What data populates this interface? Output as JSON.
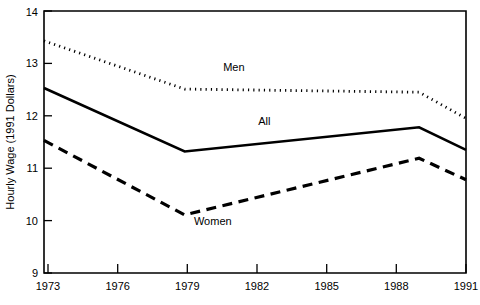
{
  "chart_data": {
    "type": "line",
    "title": "",
    "xlabel": "",
    "ylabel": "Hourly Wage (1991 Dollars)",
    "xlim": [
      1973,
      1991
    ],
    "ylim": [
      9,
      14
    ],
    "grid": false,
    "legend_position": "inline-labels",
    "x_ticks": [
      "1973",
      "1976",
      "1979",
      "1982",
      "1985",
      "1988",
      "1991"
    ],
    "y_ticks": [
      "9",
      "10",
      "11",
      "12",
      "13",
      "14"
    ],
    "x": [
      1973,
      1979,
      1989,
      1991
    ],
    "series": [
      {
        "name": "Men",
        "style": "dotted",
        "label": "Men",
        "values": [
          13.43,
          12.51,
          12.45,
          11.95
        ]
      },
      {
        "name": "All",
        "style": "solid",
        "label": "All",
        "values": [
          12.53,
          11.32,
          11.78,
          11.35
        ]
      },
      {
        "name": "Women",
        "style": "dashed",
        "label": "Women",
        "values": [
          11.53,
          10.11,
          11.19,
          10.78
        ]
      }
    ],
    "annotations": [
      {
        "text": "Men",
        "x": 1981.1,
        "y": 12.85
      },
      {
        "text": "All",
        "x": 1982.4,
        "y": 11.82
      },
      {
        "text": "Women",
        "x": 1980.2,
        "y": 9.92
      }
    ],
    "colors": {
      "line": "#000000",
      "background": "#ffffff",
      "text": "#000000"
    }
  }
}
